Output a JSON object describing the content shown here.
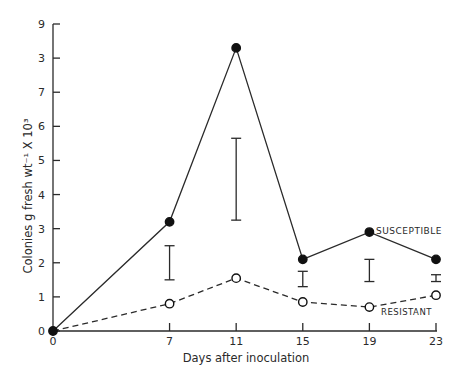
{
  "chart_data": {
    "type": "line",
    "title": "",
    "xlabel": "Days after inoculation",
    "ylabel": "Colonies  g fresh wt⁻¹  X 10³",
    "x": [
      0,
      7,
      11,
      15,
      19,
      23
    ],
    "x_tick_labels": [
      "0",
      "7",
      "11",
      "15",
      "19",
      "23"
    ],
    "y_tick_labels": [
      "0",
      "1",
      "2",
      "3",
      "4",
      "5",
      "6",
      "7",
      "3",
      "9"
    ],
    "ylim": [
      0,
      9
    ],
    "grid": false,
    "series": [
      {
        "name": "SUSCEPTIBLE",
        "style": "solid, filled circles",
        "values": [
          0,
          3.2,
          8.3,
          2.1,
          2.9,
          2.1
        ]
      },
      {
        "name": "RESISTANT",
        "style": "dashed, open circles",
        "values": [
          0,
          0.8,
          1.55,
          0.85,
          0.7,
          1.05
        ]
      }
    ],
    "error_bars": [
      {
        "x": 7,
        "low": 1.5,
        "high": 2.5
      },
      {
        "x": 11,
        "low": 3.25,
        "high": 5.65
      },
      {
        "x": 15,
        "low": 1.3,
        "high": 1.75
      },
      {
        "x": 19,
        "low": 1.45,
        "high": 2.1
      },
      {
        "x": 23,
        "low": 1.45,
        "high": 1.65
      }
    ],
    "annotations": [
      "SUSCEPTIBLE",
      "RESISTANT"
    ]
  }
}
